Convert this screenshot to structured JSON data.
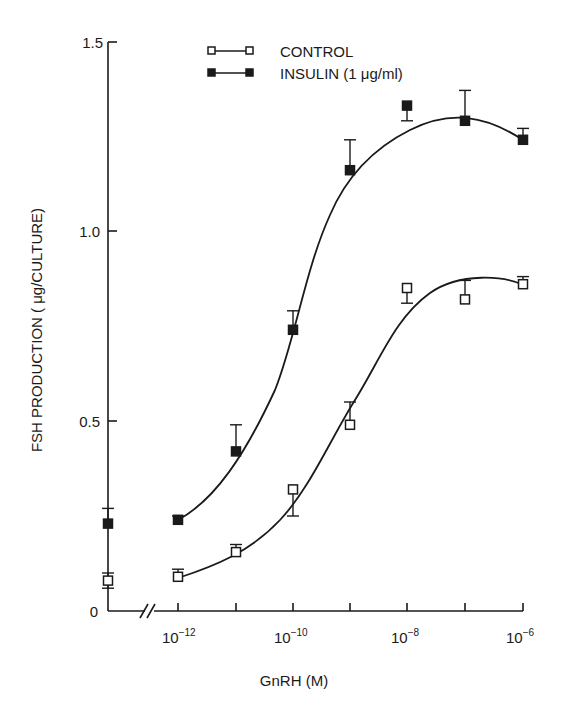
{
  "chart_data": {
    "type": "line",
    "title": "",
    "xlabel": "GnRH (M)",
    "ylabel": "FSH PRODUCTION ( μg/CULTURE)",
    "xscale": "log",
    "x_break": true,
    "x_tick_labels": [
      "10⁻¹²",
      "10⁻¹⁰",
      "10⁻⁸",
      "10⁻⁶"
    ],
    "x_ticks": [
      -12,
      -11,
      -10,
      -9,
      -8,
      -7,
      -6
    ],
    "y_tick_labels": [
      "0",
      "0.5",
      "1.0",
      "1.5"
    ],
    "y_ticks": [
      0,
      0.5,
      1.0,
      1.5
    ],
    "ylim": [
      0,
      1.5
    ],
    "grid": false,
    "legend_position": "top-center",
    "x": [
      "0",
      "1e-12",
      "1e-11",
      "1e-10",
      "1e-9",
      "1e-8",
      "1e-7",
      "1e-6"
    ],
    "series": [
      {
        "name": "CONTROL",
        "marker": "open-square",
        "values": [
          0.08,
          0.09,
          0.155,
          0.32,
          0.49,
          0.85,
          0.82,
          0.86
        ],
        "error_plus": [
          0.02,
          0.02,
          0.02,
          0.0,
          0.06,
          0.0,
          0.05,
          0.02
        ],
        "error_minus": [
          0.02,
          0.0,
          0.0,
          0.07,
          0.0,
          0.04,
          0.0,
          0.0
        ]
      },
      {
        "name": "INSULIN (1 μg/ml)",
        "marker": "filled-square",
        "values": [
          0.23,
          0.24,
          0.42,
          0.74,
          1.16,
          1.33,
          1.29,
          1.24
        ],
        "error_plus": [
          0.04,
          0.01,
          0.07,
          0.05,
          0.08,
          0.0,
          0.08,
          0.03
        ],
        "error_minus": [
          0.0,
          0.0,
          0.0,
          0.0,
          0.0,
          0.04,
          0.0,
          0.0
        ]
      }
    ]
  },
  "legend": {
    "control": "CONTROL",
    "insulin": "INSULIN (1 μg/ml)"
  },
  "axes": {
    "ylabel": "FSH PRODUCTION ( μg/CULTURE)",
    "xlabel": "GnRH (M)",
    "y_ticks": [
      "0",
      "0.5",
      "1.0",
      "1.5"
    ],
    "x_ticks": [
      {
        "base": "10",
        "exp": "−12"
      },
      {
        "base": "10",
        "exp": "−10"
      },
      {
        "base": "10",
        "exp": "−8"
      },
      {
        "base": "10",
        "exp": "−6"
      }
    ]
  }
}
